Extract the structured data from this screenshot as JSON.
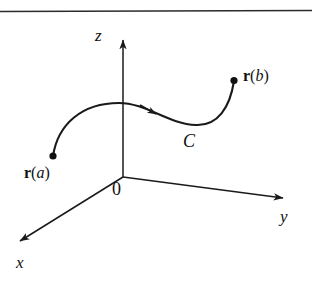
{
  "figure": {
    "kind": "3d-coordinate-axes-with-space-curve",
    "background_color": "#ffffff",
    "ink_color": "#1a1a1a",
    "top_rule": {
      "name": "horizontal-rule",
      "y": 11,
      "thickness": 1.6
    },
    "axes": [
      {
        "id": "z",
        "label": "z",
        "style": "italic",
        "from": [
          123,
          177
        ],
        "to": [
          123,
          33
        ],
        "arrow": true
      },
      {
        "id": "y",
        "label": "y",
        "style": "italic",
        "from": [
          123,
          177
        ],
        "to": [
          290,
          199
        ],
        "arrow": true
      },
      {
        "id": "x",
        "label": "x",
        "style": "italic",
        "from": [
          123,
          177
        ],
        "to": [
          13,
          246
        ],
        "arrow": true
      }
    ],
    "origin": {
      "label": "0",
      "x": 123,
      "y": 177
    },
    "curve": {
      "label": "C",
      "label_style": "italic",
      "direction_arrow": {
        "at": [
          156,
          114
        ],
        "angle_deg": 33
      },
      "endpoints": [
        {
          "id": "start",
          "point": [
            53,
            156
          ],
          "label_r": "r",
          "label_arg": "a"
        },
        {
          "id": "end",
          "point": [
            234,
            80
          ],
          "label_r": "r",
          "label_arg": "b"
        }
      ]
    },
    "labels": {
      "z": "z",
      "y": "y",
      "x": "x",
      "origin": "0",
      "curve": "C",
      "r_start": {
        "bold": "r",
        "open": "(",
        "arg": "a",
        "close": ")"
      },
      "r_end": {
        "bold": "r",
        "open": "(",
        "arg": "b",
        "close": ")"
      }
    }
  }
}
